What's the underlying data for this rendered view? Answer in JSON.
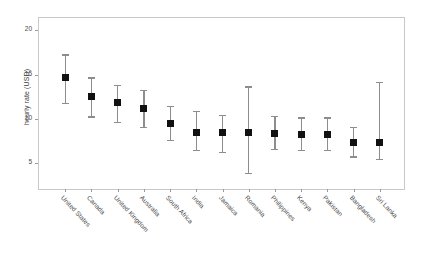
{
  "chart_data": {
    "type": "scatter",
    "title": "",
    "xlabel": "",
    "ylabel": "hourly rate (USD)",
    "ylim": [
      2,
      21.5
    ],
    "yticks": [
      5,
      10,
      15,
      20
    ],
    "ytick_labels": [
      "5",
      "10",
      "15",
      "20"
    ],
    "grid": false,
    "legend": "none",
    "marker": "filled-square",
    "marker_color": "#111111",
    "errorbar_color": "#8d8d8d",
    "frame_color": "#c9c9c9",
    "background": "#ffffff",
    "categories": [
      "United States",
      "Canada",
      "United Kingdom",
      "Australia",
      "South Africa",
      "India",
      "Jamaica",
      "Romania",
      "Philippines",
      "Kenya",
      "Pakistan",
      "Bangladesh",
      "Sri Lanka"
    ],
    "series": [
      {
        "name": "hourly rate (USD)",
        "values": [
          14.8,
          12.6,
          12.0,
          11.3,
          9.6,
          8.6,
          8.6,
          8.6,
          8.5,
          8.4,
          8.4,
          7.5,
          7.5
        ],
        "ci_lower": [
          11.9,
          10.4,
          9.8,
          9.2,
          7.8,
          6.6,
          6.4,
          4.0,
          6.7,
          6.6,
          6.6,
          5.9,
          5.6
        ],
        "ci_upper": [
          17.4,
          14.8,
          14.0,
          13.4,
          11.6,
          11.0,
          10.6,
          13.8,
          10.5,
          10.3,
          10.3,
          9.2,
          14.3
        ]
      }
    ]
  },
  "axis": {
    "y_title": "hourly rate (USD)"
  }
}
